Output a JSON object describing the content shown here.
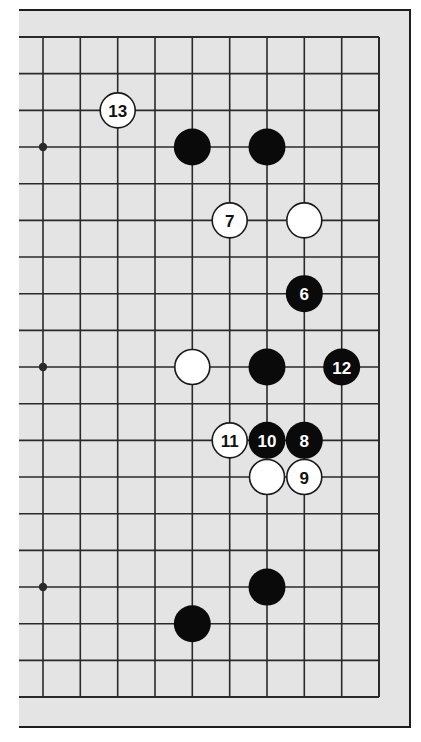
{
  "diagram": {
    "type": "go-board-partial",
    "grid": {
      "columns": 10,
      "rows": 19,
      "col_x": [
        43,
        80.3,
        117.7,
        155,
        192.3,
        229.7,
        267,
        304.3,
        341.7,
        379
      ],
      "row_y_start": 37,
      "row_spacing": 36.67,
      "right_edge_col": 9,
      "top_edge_row": 0,
      "bottom_edge_row": 18
    },
    "star_points": [
      {
        "col": 0,
        "row": 3
      },
      {
        "col": 0,
        "row": 9
      },
      {
        "col": 0,
        "row": 15
      }
    ],
    "stones": [
      {
        "color": "white",
        "col": 2,
        "row": 2,
        "label": "13"
      },
      {
        "color": "black",
        "col": 4,
        "row": 3,
        "label": ""
      },
      {
        "color": "black",
        "col": 6,
        "row": 3,
        "label": ""
      },
      {
        "color": "white",
        "col": 5,
        "row": 5,
        "label": "7"
      },
      {
        "color": "white",
        "col": 7,
        "row": 5,
        "label": ""
      },
      {
        "color": "black",
        "col": 7,
        "row": 7,
        "label": "6"
      },
      {
        "color": "white",
        "col": 4,
        "row": 9,
        "label": ""
      },
      {
        "color": "black",
        "col": 6,
        "row": 9,
        "label": ""
      },
      {
        "color": "black",
        "col": 8,
        "row": 9,
        "label": "12"
      },
      {
        "color": "white",
        "col": 5,
        "row": 11,
        "label": "11"
      },
      {
        "color": "black",
        "col": 6,
        "row": 11,
        "label": "10"
      },
      {
        "color": "black",
        "col": 7,
        "row": 11,
        "label": "8"
      },
      {
        "color": "white",
        "col": 6,
        "row": 12,
        "label": ""
      },
      {
        "color": "white",
        "col": 7,
        "row": 12,
        "label": "9"
      },
      {
        "color": "black",
        "col": 6,
        "row": 15,
        "label": ""
      },
      {
        "color": "black",
        "col": 4,
        "row": 16,
        "label": ""
      }
    ],
    "colors": {
      "board_background": "#e4e4e4",
      "page_background": "#ffffff",
      "grid_line": "#2a2a2a",
      "frame_border": "#1e1e1e",
      "black_stone": "#0a0a0a",
      "white_stone": "#ffffff",
      "black_stone_text": "#ffffff",
      "white_stone_text": "#111111"
    }
  }
}
